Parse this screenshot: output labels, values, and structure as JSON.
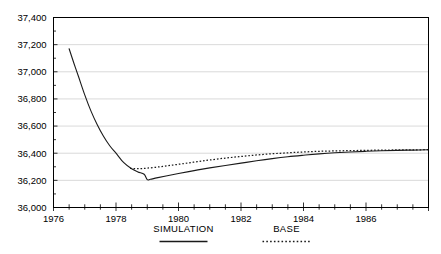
{
  "chart_data": {
    "type": "line",
    "title": "",
    "subtitle": "",
    "xlabel": "",
    "ylabel": "",
    "xlim": [
      1976,
      1988
    ],
    "ylim": [
      36000,
      37400
    ],
    "grid": true,
    "legend_position": "bottom",
    "y_ticks": [
      36000,
      36200,
      36400,
      36600,
      36800,
      37000,
      37200,
      37400
    ],
    "y_tick_labels": [
      "36,000",
      "36,200",
      "36,400",
      "36,600",
      "36,800",
      "37,000",
      "37,200",
      "37,400"
    ],
    "x_ticks": [
      1976,
      1978,
      1980,
      1982,
      1984,
      1986
    ],
    "x_tick_labels": [
      "1976",
      "1978",
      "1980",
      "1982",
      "1984",
      "1986"
    ],
    "x_minor_tick_interval": 0.5,
    "series": [
      {
        "name": "SIMULATION",
        "style": "solid",
        "color": "#1a1a1a",
        "x": [
          1976.5,
          1976.65,
          1976.8,
          1977.0,
          1977.2,
          1977.4,
          1977.6,
          1977.8,
          1978.0,
          1978.25,
          1978.5,
          1978.7,
          1978.9,
          1979.0,
          1979.1,
          1979.3,
          1979.6,
          1980.0,
          1980.5,
          1981.0,
          1981.5,
          1982.0,
          1982.5,
          1983.0,
          1983.5,
          1984.0,
          1984.5,
          1985.0,
          1985.5,
          1986.0,
          1986.5,
          1987.0,
          1987.5,
          1988.0
        ],
        "y": [
          37170,
          37065,
          36965,
          36830,
          36710,
          36610,
          36525,
          36455,
          36400,
          36330,
          36285,
          36262,
          36245,
          36205,
          36208,
          36218,
          36232,
          36250,
          36272,
          36292,
          36310,
          36327,
          36344,
          36360,
          36374,
          36385,
          36395,
          36403,
          36409,
          36414,
          36418,
          36421,
          36423,
          36425
        ]
      },
      {
        "name": "BASE",
        "style": "dotted",
        "color": "#1a1a1a",
        "x": [
          1978.45,
          1978.7,
          1979.0,
          1979.4,
          1979.8,
          1980.2,
          1980.6,
          1981.0,
          1981.5,
          1982.0,
          1982.5,
          1983.0,
          1983.5,
          1984.0,
          1984.5,
          1985.0,
          1985.5,
          1986.0,
          1986.5,
          1987.0,
          1987.5,
          1988.0
        ],
        "y": [
          36288,
          36286,
          36290,
          36300,
          36312,
          36325,
          36338,
          36350,
          36364,
          36376,
          36387,
          36396,
          36403,
          36409,
          36414,
          36417,
          36419,
          36421,
          36423,
          36424,
          36425,
          36426
        ]
      }
    ],
    "legend": [
      {
        "label": "SIMULATION",
        "style": "solid"
      },
      {
        "label": "BASE",
        "style": "dotted"
      }
    ]
  }
}
